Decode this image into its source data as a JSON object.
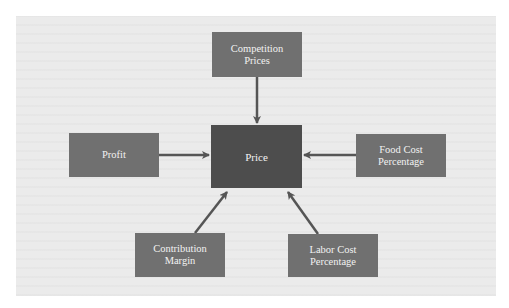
{
  "diagram": {
    "center": {
      "label": "Price",
      "color": "#4d4d4d"
    },
    "nodes": [
      {
        "id": "competition-prices",
        "line1": "Competition",
        "line2": "Prices",
        "position": "top"
      },
      {
        "id": "profit",
        "line1": "Profit",
        "line2": "",
        "position": "left"
      },
      {
        "id": "food-cost-percentage",
        "line1": "Food Cost",
        "line2": "Percentage",
        "position": "right"
      },
      {
        "id": "contribution-margin",
        "line1": "Contribution",
        "line2": "Margin",
        "position": "bottom-left"
      },
      {
        "id": "labor-cost-percentage",
        "line1": "Labor Cost",
        "line2": "Percentage",
        "position": "bottom-right"
      }
    ],
    "edges": [
      {
        "from": "competition-prices",
        "to": "price"
      },
      {
        "from": "profit",
        "to": "price"
      },
      {
        "from": "food-cost-percentage",
        "to": "price"
      },
      {
        "from": "contribution-margin",
        "to": "price"
      },
      {
        "from": "labor-cost-percentage",
        "to": "price"
      }
    ],
    "colors": {
      "node": "#707070",
      "center": "#4d4d4d",
      "arrow": "#555555",
      "background": "#ebebeb",
      "text": "#f2f2f2"
    }
  }
}
